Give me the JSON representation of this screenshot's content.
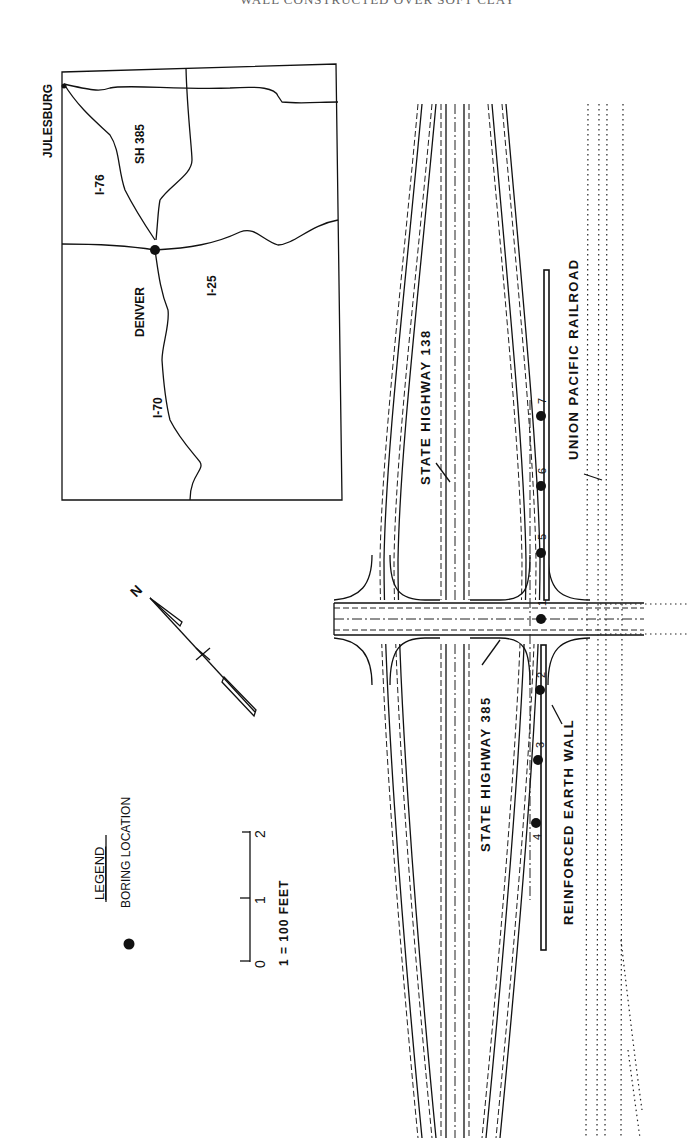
{
  "header": {
    "cut_off_title": "WALL CONSTRUCTED OVER SOFT CLAY"
  },
  "inset_map": {
    "towns": {
      "top": "JULESBURG",
      "center": "DENVER"
    },
    "roads": {
      "i76": "I-76",
      "sh385": "SH 385",
      "i25": "I-25",
      "i70": "I-70"
    }
  },
  "site_plan": {
    "labels": {
      "sh138": "STATE HIGHWAY  138",
      "sh385": "STATE HIGHWAY  385",
      "railroad": "UNION PACIFIC RAILROAD",
      "wall": "REINFORCED EARTH WALL"
    },
    "borings": [
      {
        "id": "1",
        "label": "1"
      },
      {
        "id": "2",
        "label": "2"
      },
      {
        "id": "3",
        "label": "3"
      },
      {
        "id": "4",
        "label": "4"
      },
      {
        "id": "5",
        "label": "5"
      },
      {
        "id": "6",
        "label": "6"
      },
      {
        "id": "7",
        "label": "7"
      }
    ],
    "north_arrow": {
      "label": "N"
    }
  },
  "legend": {
    "title": "LEGEND",
    "items": [
      {
        "symbol": "filled-circle",
        "label": "BORING LOCATION"
      }
    ]
  },
  "scale_bar": {
    "ticks": [
      "0",
      "1",
      "2"
    ],
    "caption": "1 = 100 FEET"
  }
}
